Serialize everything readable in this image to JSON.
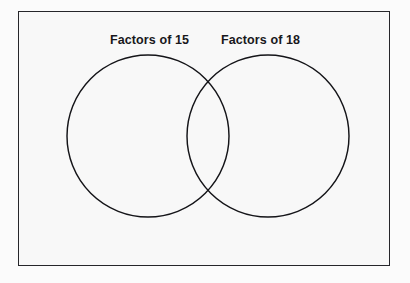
{
  "diagram": {
    "type": "venn-diagram",
    "title": "",
    "frame": {
      "border_color": "#26262a",
      "fill_color": "#f8f8f8"
    },
    "sets": [
      {
        "id": "left",
        "label": "Factors of 15",
        "cx": 148,
        "cy": 136,
        "r": 81,
        "stroke_color": "#141418"
      },
      {
        "id": "right",
        "label": "Factors of 18",
        "cx": 268,
        "cy": 136,
        "r": 81,
        "stroke_color": "#141418"
      }
    ],
    "regions": {
      "left_only_items": [],
      "intersection_items": [],
      "right_only_items": [],
      "outside_items": []
    }
  }
}
